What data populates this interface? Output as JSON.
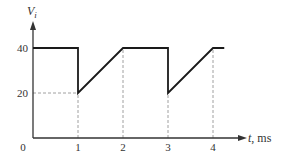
{
  "chart_data": {
    "type": "line",
    "title": "",
    "xlabel": "t, ms",
    "xlabel_var": "t",
    "xlabel_unit": ", ms",
    "ylabel": "V_i",
    "ylabel_main": "V",
    "ylabel_sub": "i",
    "x_ticks": [
      "0",
      "1",
      "2",
      "3",
      "4"
    ],
    "y_ticks": [
      "20",
      "40"
    ],
    "xlim": [
      0,
      5.4
    ],
    "ylim": [
      0,
      48
    ],
    "grid": false,
    "legend": null,
    "series": [
      {
        "name": "V_i",
        "points": [
          [
            0,
            40
          ],
          [
            1,
            40
          ],
          [
            1,
            20
          ],
          [
            2,
            40
          ],
          [
            3,
            40
          ],
          [
            3,
            20
          ],
          [
            4,
            40
          ],
          [
            4.25,
            40
          ]
        ]
      }
    ],
    "guides": [
      {
        "type": "horizontal-dashed",
        "y": 20,
        "x_from": 0,
        "x_to": 1
      },
      {
        "type": "vertical-dashed",
        "x": 1,
        "y_from": 0,
        "y_to": 20
      },
      {
        "type": "vertical-dashed",
        "x": 2,
        "y_from": 0,
        "y_to": 40
      },
      {
        "type": "vertical-dashed",
        "x": 3,
        "y_from": 0,
        "y_to": 20
      },
      {
        "type": "vertical-dashed",
        "x": 4,
        "y_from": 0,
        "y_to": 40
      }
    ]
  },
  "colors": {
    "line": "#1a1a1a",
    "axis": "#333333",
    "guide": "#888888"
  }
}
